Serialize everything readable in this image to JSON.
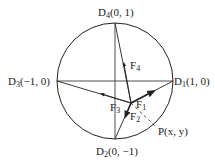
{
  "diagram": {
    "points": {
      "D1": {
        "name": "D",
        "sub": "1",
        "coords": "(1, 0)"
      },
      "D2": {
        "name": "D",
        "sub": "2",
        "coords": "(0, −1)"
      },
      "D3": {
        "name": "D",
        "sub": "3",
        "coords": "(−1, 0)"
      },
      "D4": {
        "name": "D",
        "sub": "4",
        "coords": "(0, 1)"
      },
      "P": {
        "label": "P(x, y)",
        "x": 0.27,
        "y": -0.38
      }
    },
    "forces": [
      {
        "name": "F",
        "sub": "1",
        "toward": "D1"
      },
      {
        "name": "F",
        "sub": "2",
        "toward": "D2"
      },
      {
        "name": "F",
        "sub": "3",
        "toward": "D3"
      },
      {
        "name": "F",
        "sub": "4",
        "toward": "D4"
      }
    ],
    "color": "#222222"
  }
}
